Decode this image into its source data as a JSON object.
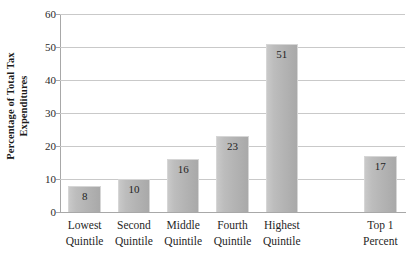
{
  "chart_data": {
    "type": "bar",
    "title": "",
    "xlabel": "",
    "ylabel": "Percentage of Total Tax Expenditures",
    "ylabel_lines": [
      "Percentage of Total Tax",
      "Expenditures"
    ],
    "categories": [
      "Lowest Quintile",
      "Second Quintile",
      "Middle Quintile",
      "Fourth Quintile",
      "Highest Quintile",
      "",
      "Top 1 Percent"
    ],
    "category_lines": [
      [
        "Lowest",
        "Quintile"
      ],
      [
        "Second",
        "Quintile"
      ],
      [
        "Middle",
        "Quintile"
      ],
      [
        "Fourth",
        "Quintile"
      ],
      [
        "Highest",
        "Quintile"
      ],
      [
        "",
        ""
      ],
      [
        "Top 1",
        "Percent"
      ]
    ],
    "values": [
      8,
      10,
      16,
      23,
      51,
      null,
      17
    ],
    "value_labels": [
      "8",
      "10",
      "16",
      "23",
      "51",
      "",
      "17"
    ],
    "ylim": [
      0,
      60
    ],
    "yticks": [
      0,
      10,
      20,
      30,
      40,
      50,
      60
    ],
    "ytick_labels": [
      "0",
      "10",
      "20",
      "30",
      "40",
      "50",
      "60"
    ],
    "grid": true,
    "grid_axis": "y",
    "legend": false,
    "legend_position": "none",
    "bar_color": "#b4b4b4",
    "bar_border_color": "#d6d6d6",
    "gridline_color": "#c9c9c9",
    "axis_color": "#a8a8a8",
    "background_color": "#ffffff",
    "text_color": "#1f1f1f"
  }
}
